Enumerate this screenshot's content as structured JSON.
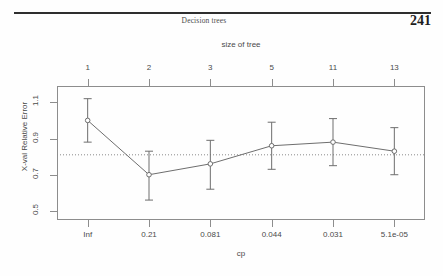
{
  "running_head": {
    "title": "Decision trees",
    "page_number": "241"
  },
  "chart_data": {
    "type": "line",
    "title": "",
    "subtitle": "",
    "xlabel": "cp",
    "ylabel": "X-val Relative Error",
    "top_axis_label": "size of tree",
    "grid": false,
    "legend": "none",
    "ylim": [
      0.45,
      1.19
    ],
    "yticks": [
      0.5,
      0.7,
      0.9,
      1.1
    ],
    "ytick_labels": [
      "0.5",
      "0.7",
      "0.9",
      "1.1"
    ],
    "x_positions": [
      1,
      2,
      3,
      4,
      5,
      6
    ],
    "xtick_labels_bottom": [
      "Inf",
      "0.21",
      "0.081",
      "0.044",
      "0.031",
      "5.1e-05"
    ],
    "xtick_labels_top": [
      "1",
      "2",
      "3",
      "5",
      "11",
      "13"
    ],
    "series": [
      {
        "name": "X-val Relative Error",
        "values": [
          1.0,
          0.7,
          0.76,
          0.86,
          0.88,
          0.83
        ],
        "err_low": [
          0.88,
          0.56,
          0.62,
          0.73,
          0.75,
          0.7
        ],
        "err_high": [
          1.12,
          0.83,
          0.89,
          0.99,
          1.01,
          0.96
        ],
        "marker": "open-circle",
        "color": "#6e6e6e"
      }
    ],
    "reference_line": {
      "type": "horizontal-dotted",
      "value": 0.81,
      "color": "#8a8a8a"
    },
    "colors": {
      "axis": "#8d8d8d",
      "line": "#6e6e6e",
      "text": "#4a4a4a"
    }
  }
}
